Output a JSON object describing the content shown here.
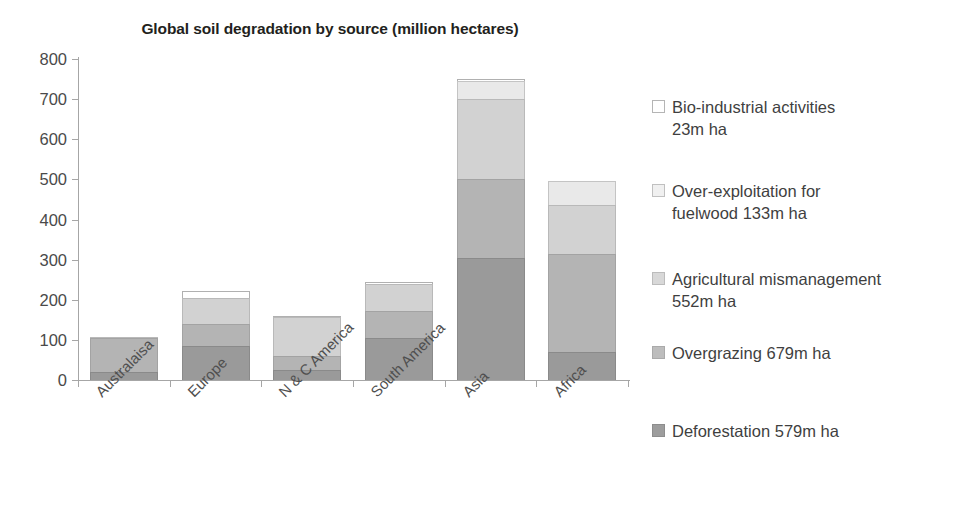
{
  "chart_data": {
    "type": "bar",
    "subtype": "stacked-bar",
    "title": "Global soil degradation by source (million hectares)",
    "xlabel": "",
    "ylabel": "",
    "ylim": [
      0,
      800
    ],
    "ytick_interval": 100,
    "yticks": [
      "800",
      "700",
      "600",
      "500",
      "400",
      "300",
      "200",
      "100",
      "0"
    ],
    "grid": false,
    "legend_position": "right",
    "categories": [
      "Australaisa",
      "Europe",
      "N & C America",
      "South America",
      "Asia",
      "Africa"
    ],
    "series": [
      {
        "name": "Deforestation",
        "legend_label": "Deforestation 579m ha",
        "total": "579m ha",
        "color": "#9a9a9a",
        "values": [
          20,
          85,
          25,
          105,
          305,
          70
        ]
      },
      {
        "name": "Overgrazing",
        "legend_label": "Overgrazing 679m ha",
        "total": "679m ha",
        "color": "#b4b4b4",
        "values": [
          85,
          55,
          35,
          67,
          195,
          245
        ]
      },
      {
        "name": "Agricultural mismanagement",
        "legend_label": "Agricultural mismanagement 552m ha",
        "total": "552m ha",
        "color": "#d2d2d2",
        "values": [
          2,
          65,
          98,
          68,
          200,
          120
        ]
      },
      {
        "name": "Over-exploitation for fuelwood",
        "legend_label": "Over-exploitation for fuelwood 133m ha",
        "total": "133m ha",
        "color": "#e9e9e9",
        "values": [
          0,
          0,
          0,
          0,
          45,
          62
        ]
      },
      {
        "name": "Bio-industrial activities",
        "legend_label": "Bio-industrial activities 23m ha",
        "total": "23m ha",
        "color": "#ffffff",
        "values": [
          0,
          17,
          2,
          5,
          5,
          0
        ]
      }
    ],
    "category_totals": [
      107,
      222,
      160,
      245,
      750,
      497
    ]
  },
  "legend": {
    "items": [
      {
        "line1": "Bio-industrial activities",
        "line2": "23m ha"
      },
      {
        "line1": "Over-exploitation for",
        "line2": "fuelwood 133m ha"
      },
      {
        "line1": "Agricultural mismanagement",
        "line2": "552m ha"
      },
      {
        "line1": "Overgrazing 679m ha",
        "line2": ""
      },
      {
        "line1": "Deforestation 579m ha",
        "line2": ""
      }
    ]
  }
}
